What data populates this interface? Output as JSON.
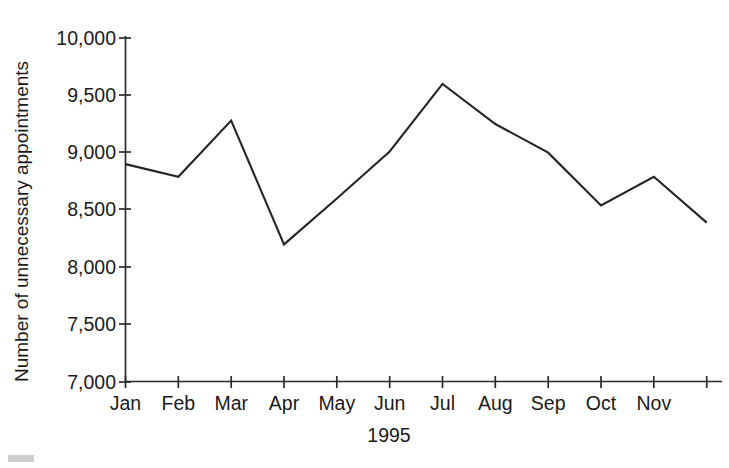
{
  "chart_data": {
    "type": "line",
    "title": "",
    "subtitle": "",
    "xlabel": "1995",
    "ylabel": "Number of unnecessary appointments",
    "categories": [
      "Jan",
      "Feb",
      "Mar",
      "Apr",
      "May",
      "Jun",
      "Jul",
      "Aug",
      "Sep",
      "Oct",
      "Nov",
      "Dec"
    ],
    "tick_labels_x": [
      "Jan",
      "Feb",
      "Mar",
      "Apr",
      "May",
      "Jun",
      "Jul",
      "Aug",
      "Sep",
      "Oct",
      "Nov",
      ""
    ],
    "tick_labels_y": [
      "10,000",
      "9,500",
      "9,000",
      "8,500",
      "8,000",
      "7,500",
      "7,000"
    ],
    "tick_values_y": [
      10000,
      9500,
      9000,
      8500,
      8000,
      7500,
      7000
    ],
    "values": [
      8900,
      8790,
      9280,
      8200,
      8600,
      9010,
      9600,
      9250,
      9000,
      8540,
      8790,
      8390
    ],
    "ylim": [
      7000,
      10000
    ],
    "xlim": [
      0,
      11
    ],
    "grid": false,
    "legend": null,
    "legend_position": "none",
    "series": [
      {
        "name": "Unnecessary appointments",
        "color": "#252525",
        "values": [
          8900,
          8790,
          9280,
          8200,
          8600,
          9010,
          9600,
          9250,
          9000,
          8540,
          8790,
          8390
        ]
      }
    ],
    "annotations": [],
    "colors": {
      "line": "#252525",
      "axis": "#2b2b2b",
      "text": "#1a1a1a",
      "background": "#ffffff"
    }
  },
  "figure": {
    "corner_mark_present": true
  }
}
